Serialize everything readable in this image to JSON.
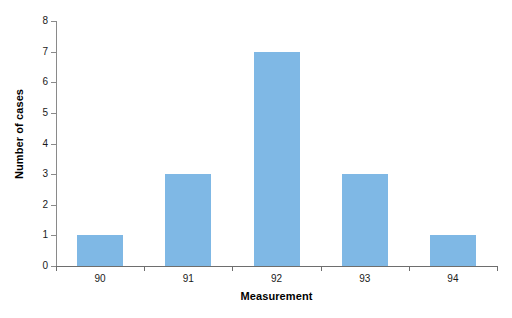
{
  "chart_data": {
    "type": "bar",
    "title": "",
    "subtitle": "",
    "xlabel": "Measurement",
    "ylabel": "Number of cases",
    "categories": [
      "90",
      "91",
      "92",
      "93",
      "94"
    ],
    "values": [
      1,
      3,
      7,
      3,
      1
    ],
    "series": [
      {
        "name": "Number of cases",
        "values": [
          1,
          3,
          7,
          3,
          1
        ]
      }
    ],
    "ylim": [
      0,
      8
    ],
    "ytick_labels": [
      "0",
      "1",
      "2",
      "3",
      "4",
      "5",
      "6",
      "7",
      "8"
    ],
    "ytick_values": [
      0,
      1,
      2,
      3,
      4,
      5,
      6,
      7,
      8
    ],
    "xtick_labels": [
      "90",
      "91",
      "92",
      "93",
      "94"
    ],
    "grid": false,
    "legend": false,
    "legend_position": "none",
    "annotations": [],
    "bar_color": "#7fb8e5",
    "axis_color": "#6e6e6e",
    "background_color": "#ffffff"
  }
}
